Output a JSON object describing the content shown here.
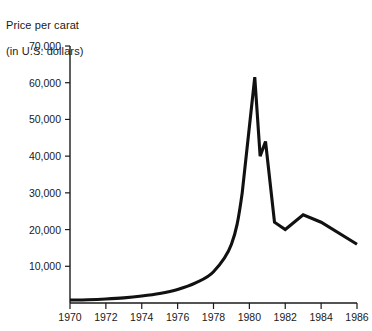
{
  "chart_data": {
    "type": "line",
    "title": "Price per carat (in U.S. dollars)",
    "title_lines": [
      "Price per carat",
      "(in U.S. dollars)"
    ],
    "xlabel": "",
    "ylabel": "Price per carat (in U.S. dollars)",
    "xlim": [
      1970,
      1986
    ],
    "ylim": [
      0,
      70000
    ],
    "grid": false,
    "legend": null,
    "line_color": "#111111",
    "background_color": "#ffffff",
    "axis_color": "#1a1a1a",
    "xticks": [
      1970,
      1972,
      1974,
      1976,
      1978,
      1980,
      1982,
      1984,
      1986
    ],
    "xtick_labels": [
      "1970",
      "1972",
      "1974",
      "1976",
      "1978",
      "1980",
      "1982",
      "1984",
      "1986"
    ],
    "yticks": [
      10000,
      20000,
      30000,
      40000,
      50000,
      60000,
      70000
    ],
    "ytick_labels": [
      "10,000",
      "20,000",
      "30,000",
      "40,000",
      "50,000",
      "60,000",
      "70,000"
    ],
    "series": [
      {
        "name": "Price per carat",
        "x": [
          1970,
          1971,
          1972,
          1973,
          1974,
          1975,
          1976,
          1977,
          1978,
          1979,
          1979.6,
          1980.3,
          1980.6,
          1980.9,
          1981.4,
          1982,
          1983,
          1984,
          1986
        ],
        "values": [
          800,
          900,
          1100,
          1400,
          1900,
          2600,
          3700,
          5500,
          8500,
          16000,
          30000,
          61500,
          40000,
          44000,
          22000,
          20000,
          24000,
          22000,
          16000
        ]
      }
    ],
    "annotations": [
      {
        "text": "peak",
        "x": 1980.3,
        "y": 61500
      },
      {
        "text": "secondary spike",
        "x": 1980.9,
        "y": 44000
      },
      {
        "text": "trough",
        "x": 1982,
        "y": 20000
      },
      {
        "text": "end",
        "x": 1986,
        "y": 16000
      }
    ]
  }
}
